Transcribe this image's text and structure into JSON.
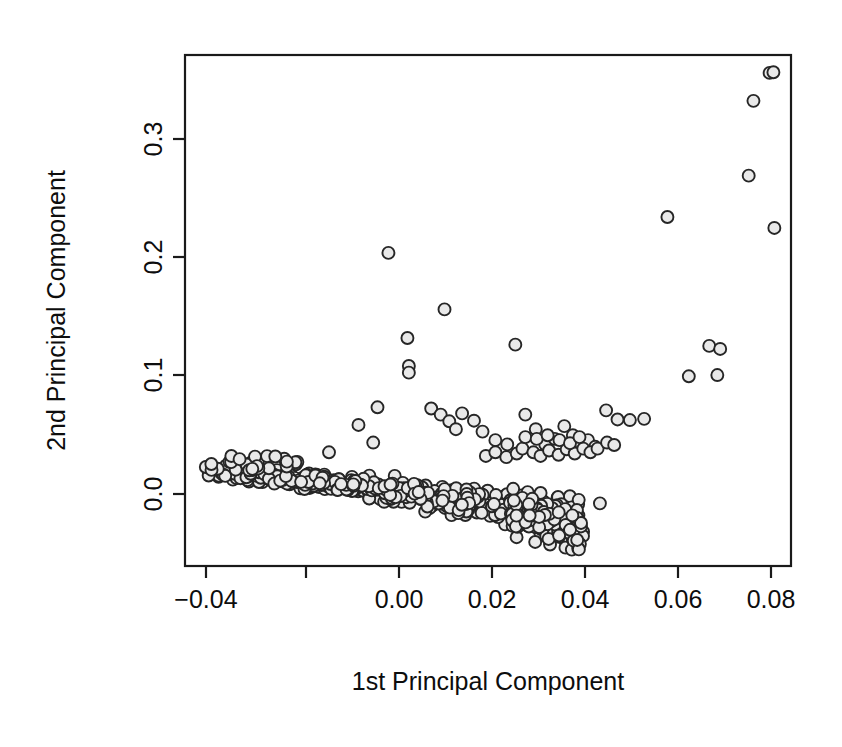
{
  "figure": {
    "background_color": "#ffffff",
    "ink_color": "#1a1a1a",
    "point_fill_color": "#e9e9e9",
    "point_stroke_color": "#262626",
    "width": 842,
    "height": 747
  },
  "plot_area": {
    "left": 185,
    "top": 55,
    "right": 791,
    "bottom": 566,
    "frame": true
  },
  "axes": {
    "x": {
      "label": "1st Principal Component",
      "tick_values": [
        -0.04,
        -0.02,
        0.0,
        0.02,
        0.04,
        0.06,
        0.08
      ],
      "tick_labels": [
        "-0.04",
        "",
        "0.00",
        "0.02",
        "0.04",
        "0.06",
        "0.08"
      ],
      "tick_pixels": [
        206,
        306,
        399,
        492,
        585,
        678,
        771
      ],
      "range": [
        -0.0448,
        0.0827
      ]
    },
    "y": {
      "label": "2nd Principal Component",
      "tick_values": [
        0.0,
        0.1,
        0.2,
        0.3
      ],
      "tick_labels": [
        "0.0",
        "0.1",
        "0.2",
        "0.3"
      ],
      "tick_pixels": [
        494,
        375,
        257,
        139
      ],
      "range": [
        -0.0605,
        0.3597
      ],
      "rotated": true
    }
  },
  "chart_data": {
    "type": "scatter",
    "title": "",
    "xlabel": "1st Principal Component",
    "ylabel": "2nd Principal Component",
    "xlim": [
      -0.0448,
      0.0827
    ],
    "ylim": [
      -0.0605,
      0.3597
    ],
    "grid": false,
    "legend": null,
    "marker": {
      "shape": "circle",
      "size": 12,
      "fill": "#e9e9e9",
      "edge": "#262626"
    },
    "n_points": 742,
    "series": [
      {
        "name": "observations",
        "description": "Dense elongated main band near y=0 spanning x=-0.040..0.038, a descending tail to y=-0.045, an arc of moderate outliers at y=0.03..0.07 for x=0.018..0.052, and sparse high outliers up to y=0.345 at x=0.079.",
        "outlier_points": [
          [
            -0.002,
            0.197
          ],
          [
            0.0098,
            0.1505
          ],
          [
            0.002,
            0.127
          ],
          [
            0.0247,
            0.1215
          ],
          [
            0.0023,
            0.104
          ],
          [
            0.0023,
            0.0985
          ],
          [
            -0.0083,
            0.0555
          ],
          [
            -0.0052,
            0.041
          ],
          [
            -0.0043,
            0.07
          ],
          [
            -0.0145,
            0.033
          ],
          [
            0.007,
            0.069
          ],
          [
            0.009,
            0.064
          ],
          [
            0.0108,
            0.0585
          ],
          [
            0.0122,
            0.052
          ],
          [
            0.0135,
            0.065
          ],
          [
            0.016,
            0.059
          ],
          [
            0.0178,
            0.05
          ],
          [
            0.0205,
            0.043
          ],
          [
            0.023,
            0.0395
          ],
          [
            0.0268,
            0.064
          ],
          [
            0.029,
            0.052
          ],
          [
            0.031,
            0.0395
          ],
          [
            0.033,
            0.044
          ],
          [
            0.035,
            0.0545
          ],
          [
            0.0368,
            0.047
          ],
          [
            0.0385,
            0.04
          ],
          [
            0.04,
            0.043
          ],
          [
            0.0415,
            0.0375
          ],
          [
            0.0425,
            -0.009
          ],
          [
            0.0438,
            0.0675
          ],
          [
            0.0462,
            0.06
          ],
          [
            0.0488,
            0.0595
          ],
          [
            0.0518,
            0.0605
          ],
          [
            0.0567,
            0.2265
          ],
          [
            0.0612,
            0.0955
          ],
          [
            0.0655,
            0.1205
          ],
          [
            0.0678,
            0.118
          ],
          [
            0.0672,
            0.0965
          ],
          [
            0.0738,
            0.2605
          ],
          [
            0.0748,
            0.322
          ],
          [
            0.0782,
            0.345
          ],
          [
            0.079,
            0.3455
          ],
          [
            0.0792,
            0.2175
          ]
        ]
      }
    ]
  }
}
